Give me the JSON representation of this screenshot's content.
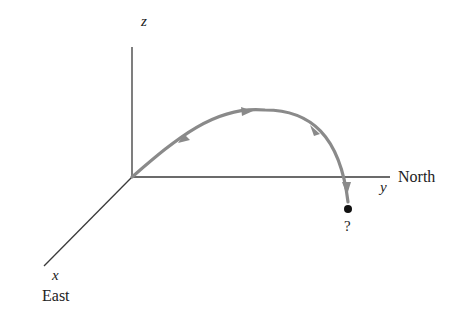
{
  "diagram": {
    "type": "3d-trajectory",
    "axes": {
      "z": {
        "label": "z"
      },
      "y": {
        "label": "y",
        "direction": "North"
      },
      "x": {
        "label": "x",
        "direction": "East"
      }
    },
    "endpoint_label": "?",
    "colors": {
      "axis": "#3a3a3a",
      "path": "#8a8a8a",
      "endpoint": "#111111"
    }
  }
}
